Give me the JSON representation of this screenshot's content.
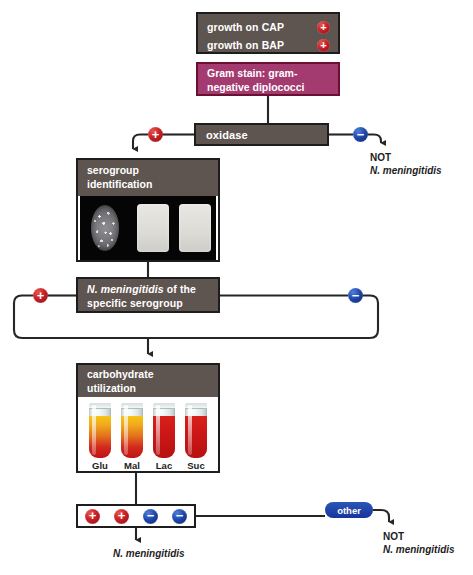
{
  "diagram": {
    "colors": {
      "brown_box": "#5f5550",
      "pink_box": "#a33a70",
      "positive_red": "#c62026",
      "negative_blue": "#1d45a8",
      "other_pill_blue": "#16359a",
      "line": "#262626",
      "photo_background": "#050505"
    }
  },
  "growth": {
    "rows": [
      {
        "label": "growth on CAP",
        "result": "+",
        "result_name": "positive"
      },
      {
        "label": "growth on BAP",
        "result": "+",
        "result_name": "positive"
      }
    ]
  },
  "gram_stain": {
    "line1": "Gram stain: gram-",
    "line2": "negative diplococci"
  },
  "oxidase": {
    "label": "oxidase",
    "positive_branch": {
      "symbol": "+",
      "leads_to": "serogroup identification"
    },
    "negative_branch": {
      "symbol": "−",
      "terminal_line1": "NOT",
      "terminal_line2": "N. meningitidis"
    }
  },
  "serogroup_card": {
    "header_line1": "serogroup",
    "header_line2": "identification",
    "photo": {
      "name": "agglutination-test-photo",
      "elements": [
        "granular agglutination oval",
        "clear slab 1",
        "clear slab 2"
      ]
    }
  },
  "nm_serogroup": {
    "line1_italic": "N. meningitidis",
    "line1_rest": " of the",
    "line2": "specific serogroup",
    "positive_branch_symbol": "+",
    "negative_branch_symbol": "−"
  },
  "carbohydrate_card": {
    "header_line1": "carbohydrate",
    "header_line2": "utilization",
    "tubes": [
      {
        "label": "Glu",
        "state": "positive",
        "name": "glucose-tube"
      },
      {
        "label": "Mal",
        "state": "positive",
        "name": "maltose-tube"
      },
      {
        "label": "Lac",
        "state": "negative",
        "name": "lactose-tube"
      },
      {
        "label": "Suc",
        "state": "negative",
        "name": "sucrose-tube"
      }
    ]
  },
  "results_row": {
    "symbols": [
      {
        "symbol": "+",
        "name": "glucose-result"
      },
      {
        "symbol": "+",
        "name": "maltose-result"
      },
      {
        "symbol": "−",
        "name": "lactose-result"
      },
      {
        "symbol": "−",
        "name": "sucrose-result"
      }
    ],
    "final_label": "N. meningitidis"
  },
  "other_branch": {
    "pill_label": "other",
    "terminal_line1": "NOT",
    "terminal_line2": "N. meningitidis"
  }
}
